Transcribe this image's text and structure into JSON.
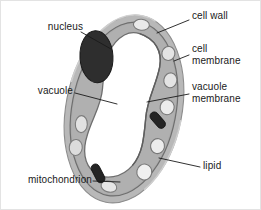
{
  "figure": {
    "type": "biological-diagram",
    "background_color": "#ffffff",
    "border_color": "#e3e3e3",
    "colors": {
      "cell_wall": "#b5b5b5",
      "cell_wall_outline": "#808080",
      "cytoplasm": "#b0b0b0",
      "cell_membrane": "#8a8a8a",
      "vacuole_fill": "#ffffff",
      "vacuole_membrane": "#707070",
      "nucleus": "#2b2b2b",
      "mitochondrion": "#1f1f1f",
      "lipid_fill": "#e8e8e8",
      "lipid_outline": "#757575",
      "leader_line": "#1a1a1a",
      "text": "#1a1a1a"
    },
    "organelles": {
      "nucleus_count": 1,
      "mitochondria_count": 2,
      "lipid_count": 8,
      "vacuole_count": 1
    }
  },
  "labels": [
    {
      "id": "nucleus",
      "text": "nucleus",
      "side": "left",
      "x": 42,
      "y": 26,
      "lines": 1
    },
    {
      "id": "vacuole",
      "text": "vacuole",
      "side": "left",
      "x": 30,
      "y": 90,
      "lines": 1
    },
    {
      "id": "mitochondrion",
      "text": "mitochondrion",
      "side": "left",
      "x": 13,
      "y": 176,
      "lines": 1
    },
    {
      "id": "cell-wall",
      "text": "cell wall",
      "side": "right",
      "x": 191,
      "y": 15,
      "lines": 1
    },
    {
      "id": "cell-membrane",
      "text": "cell\nmembrane",
      "side": "right",
      "x": 191,
      "y": 48,
      "lines": 2
    },
    {
      "id": "vacuole-membrane",
      "text": "vacuole\nmembrane",
      "side": "right",
      "x": 191,
      "y": 86,
      "lines": 2
    },
    {
      "id": "lipid",
      "text": "lipid",
      "side": "right",
      "x": 202,
      "y": 163,
      "lines": 1
    }
  ],
  "leaders": [
    {
      "id": "nucleus-leader",
      "from": [
        80,
        32
      ],
      "to": [
        108,
        46
      ]
    },
    {
      "id": "vacuole-leader",
      "from": [
        74,
        93
      ],
      "to": [
        115,
        102
      ]
    },
    {
      "id": "mitochondrion-leader",
      "from": [
        92,
        180
      ],
      "to": [
        117,
        181
      ]
    },
    {
      "id": "cell-wall-leader",
      "from": [
        188,
        19
      ],
      "to": [
        157,
        32
      ]
    },
    {
      "id": "cell-membrane-leader",
      "from": [
        188,
        54
      ],
      "to": [
        172,
        59
      ]
    },
    {
      "id": "vacuole-membrane-leader",
      "from": [
        188,
        93
      ],
      "to": [
        147,
        101
      ]
    },
    {
      "id": "lipid-leader",
      "from": [
        199,
        166
      ],
      "to": [
        159,
        158
      ]
    }
  ]
}
